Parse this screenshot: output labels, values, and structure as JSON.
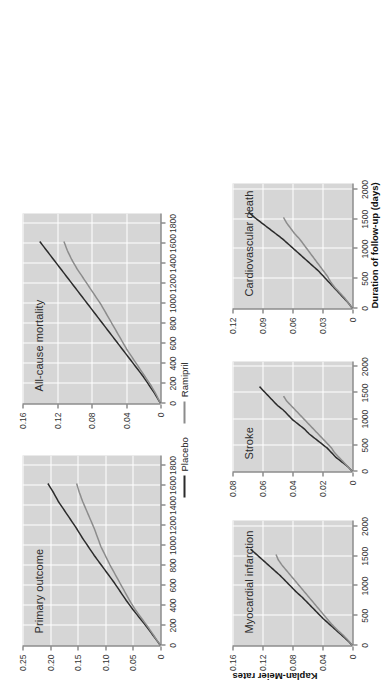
{
  "figure": {
    "xlabel": "Duration of follow-up (days)",
    "ylabel": "Kaplan-Meier rates",
    "rotation_note": "figure rendered rotated 90 degrees counter-clockwise",
    "colors": {
      "placebo": "#2b2b2b",
      "ramipril": "#8c8c8c",
      "plot_background": "#d6d6d6",
      "gridline": "#ffffff",
      "axis": "#555555"
    }
  },
  "legend": {
    "position": "center",
    "entries": [
      {
        "label": "Placebo",
        "color": "#2b2b2b",
        "marker": "line"
      },
      {
        "label": "Ramipril",
        "color": "#8c8c8c",
        "marker": "line"
      }
    ]
  },
  "chart_data": [
    {
      "type": "line",
      "title": "Primary outcome",
      "xlabel": "Duration of follow-up (days)",
      "ylabel": "Kaplan-Meier rates",
      "xlim": [
        0,
        1900
      ],
      "ylim": [
        0,
        0.25
      ],
      "xticks": [
        0,
        200,
        400,
        600,
        800,
        1000,
        1200,
        1400,
        1600,
        1800
      ],
      "yticks": [
        0,
        0.05,
        0.1,
        0.15,
        0.2,
        0.25
      ],
      "ytick_labels": [
        "0",
        "0.05",
        "0.10",
        "0.15",
        "0.20",
        "0.25"
      ],
      "grid": true,
      "series": [
        {
          "name": "Placebo",
          "color": "#2b2b2b",
          "x": [
            0,
            90,
            180,
            270,
            360,
            450,
            540,
            630,
            720,
            810,
            900,
            990,
            1080,
            1170,
            1260,
            1350,
            1440,
            1530,
            1620
          ],
          "y": [
            0.0,
            0.012,
            0.024,
            0.037,
            0.05,
            0.062,
            0.073,
            0.084,
            0.096,
            0.108,
            0.12,
            0.131,
            0.142,
            0.152,
            0.163,
            0.174,
            0.185,
            0.194,
            0.204
          ]
        },
        {
          "name": "Ramipril",
          "color": "#8c8c8c",
          "x": [
            0,
            90,
            180,
            270,
            360,
            450,
            540,
            630,
            720,
            810,
            900,
            990,
            1080,
            1170,
            1260,
            1350,
            1440,
            1530,
            1620
          ],
          "y": [
            0.0,
            0.011,
            0.022,
            0.034,
            0.046,
            0.056,
            0.065,
            0.074,
            0.083,
            0.092,
            0.1,
            0.108,
            0.114,
            0.12,
            0.127,
            0.134,
            0.141,
            0.147,
            0.152
          ]
        }
      ]
    },
    {
      "type": "line",
      "title": "All-cause mortality",
      "xlabel": "Duration of follow-up (days)",
      "ylabel": "Kaplan-Meier rates",
      "xlim": [
        0,
        1900
      ],
      "ylim": [
        0,
        0.16
      ],
      "xticks": [
        0,
        200,
        400,
        600,
        800,
        1000,
        1200,
        1400,
        1600,
        1800
      ],
      "yticks": [
        0,
        0.04,
        0.08,
        0.12,
        0.16
      ],
      "ytick_labels": [
        "0",
        "0.04",
        "0.08",
        "0.12",
        "0.16"
      ],
      "grid": true,
      "series": [
        {
          "name": "Placebo",
          "color": "#2b2b2b",
          "x": [
            0,
            90,
            180,
            270,
            360,
            450,
            540,
            630,
            720,
            810,
            900,
            990,
            1080,
            1170,
            1260,
            1350,
            1440,
            1530,
            1620
          ],
          "y": [
            0.0,
            0.006,
            0.013,
            0.02,
            0.028,
            0.036,
            0.044,
            0.052,
            0.06,
            0.068,
            0.076,
            0.084,
            0.092,
            0.1,
            0.108,
            0.116,
            0.124,
            0.132,
            0.14
          ]
        },
        {
          "name": "Ramipril",
          "color": "#8c8c8c",
          "x": [
            0,
            90,
            180,
            270,
            360,
            450,
            540,
            630,
            720,
            810,
            900,
            990,
            1080,
            1170,
            1260,
            1350,
            1440,
            1530,
            1620
          ],
          "y": [
            0.0,
            0.005,
            0.011,
            0.018,
            0.025,
            0.032,
            0.039,
            0.045,
            0.051,
            0.057,
            0.063,
            0.069,
            0.076,
            0.083,
            0.09,
            0.097,
            0.103,
            0.108,
            0.112
          ]
        }
      ]
    },
    {
      "type": "line",
      "title": "Myocardial infarction",
      "xlabel": "Duration of follow-up (days)",
      "ylabel": "Kaplan-Meier rates",
      "xlim": [
        0,
        2100
      ],
      "ylim": [
        0,
        0.16
      ],
      "xticks": [
        0,
        500,
        1000,
        1500,
        2000
      ],
      "yticks": [
        0,
        0.04,
        0.08,
        0.12,
        0.16
      ],
      "ytick_labels": [
        "0",
        "0.04",
        "0.08",
        "0.12",
        "0.16"
      ],
      "grid": true,
      "series": [
        {
          "name": "Placebo",
          "color": "#2b2b2b",
          "x": [
            0,
            90,
            180,
            270,
            360,
            450,
            540,
            630,
            720,
            810,
            900,
            990,
            1080,
            1170,
            1260,
            1350,
            1440,
            1530,
            1620
          ],
          "y": [
            0.0,
            0.007,
            0.015,
            0.023,
            0.031,
            0.039,
            0.046,
            0.053,
            0.06,
            0.067,
            0.075,
            0.082,
            0.089,
            0.096,
            0.104,
            0.112,
            0.12,
            0.128,
            0.136
          ]
        },
        {
          "name": "Ramipril",
          "color": "#8c8c8c",
          "x": [
            0,
            90,
            180,
            270,
            360,
            450,
            540,
            630,
            720,
            810,
            900,
            990,
            1080,
            1170,
            1260,
            1350,
            1440,
            1530
          ],
          "y": [
            0.0,
            0.006,
            0.013,
            0.021,
            0.028,
            0.034,
            0.04,
            0.046,
            0.052,
            0.058,
            0.064,
            0.07,
            0.076,
            0.082,
            0.088,
            0.094,
            0.099,
            0.102
          ]
        }
      ]
    },
    {
      "type": "line",
      "title": "Stroke",
      "xlabel": "Duration of follow-up (days)",
      "ylabel": "Kaplan-Meier rates",
      "xlim": [
        0,
        2100
      ],
      "ylim": [
        0,
        0.08
      ],
      "xticks": [
        0,
        500,
        1000,
        1500,
        2000
      ],
      "yticks": [
        0,
        0.02,
        0.04,
        0.06,
        0.08
      ],
      "ytick_labels": [
        "0",
        "0.02",
        "0.04",
        "0.06",
        "0.08"
      ],
      "grid": true,
      "series": [
        {
          "name": "Placebo",
          "color": "#2b2b2b",
          "x": [
            0,
            90,
            180,
            270,
            360,
            450,
            540,
            630,
            720,
            810,
            900,
            990,
            1080,
            1170,
            1260,
            1350,
            1440,
            1530,
            1620
          ],
          "y": [
            0.0,
            0.003,
            0.007,
            0.011,
            0.014,
            0.017,
            0.021,
            0.025,
            0.029,
            0.032,
            0.036,
            0.04,
            0.043,
            0.046,
            0.05,
            0.053,
            0.056,
            0.059,
            0.062
          ]
        },
        {
          "name": "Ramipril",
          "color": "#8c8c8c",
          "x": [
            0,
            90,
            180,
            270,
            360,
            450,
            540,
            630,
            720,
            810,
            900,
            990,
            1080,
            1170,
            1260,
            1350,
            1440
          ],
          "y": [
            0.0,
            0.003,
            0.006,
            0.009,
            0.012,
            0.014,
            0.017,
            0.02,
            0.023,
            0.026,
            0.029,
            0.032,
            0.035,
            0.038,
            0.041,
            0.044,
            0.046
          ]
        }
      ]
    },
    {
      "type": "line",
      "title": "Cardiovascular death",
      "xlabel": "Duration of follow-up (days)",
      "ylabel": "Kaplan-Meier rates",
      "xlim": [
        0,
        2100
      ],
      "ylim": [
        0,
        0.12
      ],
      "xticks": [
        0,
        500,
        1000,
        1500,
        2000
      ],
      "yticks": [
        0,
        0.03,
        0.06,
        0.09,
        0.12
      ],
      "ytick_labels": [
        "0",
        "0.03",
        "0.06",
        "0.09",
        "0.12"
      ],
      "grid": true,
      "series": [
        {
          "name": "Placebo",
          "color": "#2b2b2b",
          "x": [
            0,
            90,
            180,
            270,
            360,
            450,
            540,
            630,
            720,
            810,
            900,
            990,
            1080,
            1170,
            1260,
            1350,
            1440,
            1530,
            1620
          ],
          "y": [
            0.0,
            0.004,
            0.009,
            0.014,
            0.019,
            0.024,
            0.029,
            0.034,
            0.04,
            0.046,
            0.052,
            0.058,
            0.064,
            0.07,
            0.077,
            0.084,
            0.091,
            0.098,
            0.104
          ]
        },
        {
          "name": "Ramipril",
          "color": "#8c8c8c",
          "x": [
            0,
            90,
            180,
            270,
            360,
            450,
            540,
            630,
            720,
            810,
            900,
            990,
            1080,
            1170,
            1260,
            1350,
            1440,
            1530
          ],
          "y": [
            0.0,
            0.004,
            0.008,
            0.013,
            0.018,
            0.022,
            0.025,
            0.029,
            0.033,
            0.037,
            0.041,
            0.045,
            0.049,
            0.053,
            0.058,
            0.062,
            0.066,
            0.069
          ]
        }
      ]
    }
  ]
}
